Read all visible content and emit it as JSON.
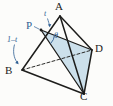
{
  "figure": {
    "type": "geometry-diagram",
    "background_color": "#fcfcfa",
    "shade_color": "#c3dae8",
    "shade_opacity": 0.85,
    "edge_color": "#1d1d1b",
    "annotation_color": "#2f5f93",
    "vertices": [
      {
        "name": "A",
        "label": "A",
        "x": 60,
        "y": 16
      },
      {
        "name": "B",
        "label": "B",
        "x": 22,
        "y": 70
      },
      {
        "name": "C",
        "label": "C",
        "x": 84,
        "y": 94
      },
      {
        "name": "D",
        "label": "D",
        "x": 92,
        "y": 50
      },
      {
        "name": "P",
        "label": "P",
        "x": 41,
        "y": 30
      }
    ],
    "labels": {
      "A": "A",
      "B": "B",
      "C": "C",
      "D": "D",
      "P": "P",
      "t": "t",
      "one_minus_t": "1–t",
      "theta": "θ"
    },
    "edges": [
      {
        "name": "A-B",
        "from": "A",
        "to": "B",
        "style": "solid"
      },
      {
        "name": "A-C",
        "from": "A",
        "to": "C",
        "style": "solid"
      },
      {
        "name": "A-D",
        "from": "A",
        "to": "D",
        "style": "solid"
      },
      {
        "name": "B-C",
        "from": "B",
        "to": "C",
        "style": "solid"
      },
      {
        "name": "C-D",
        "from": "C",
        "to": "D",
        "style": "solid"
      },
      {
        "name": "B-D",
        "from": "B",
        "to": "D",
        "style": "dashed"
      }
    ],
    "construction_lines": [
      {
        "name": "P-C",
        "from": "P",
        "to": "C",
        "style": "solid"
      },
      {
        "name": "P-D",
        "from": "P",
        "to": "D",
        "style": "solid"
      }
    ],
    "shaded_face": {
      "name": "triangle-PDC",
      "vertices": [
        "P",
        "D",
        "C"
      ]
    },
    "angle_marker": {
      "name": "angle-theta",
      "at": "P",
      "between": [
        "P-D",
        "P-C"
      ],
      "label": "θ"
    },
    "segment_labels": [
      {
        "name": "segment-PA",
        "label": "t",
        "segment": "P-A"
      },
      {
        "name": "segment-BP",
        "label": "1–t",
        "segment": "B-P"
      }
    ]
  }
}
